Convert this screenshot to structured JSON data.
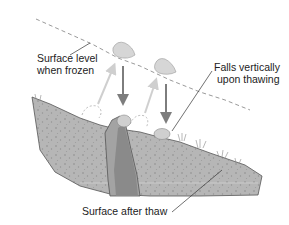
{
  "diagram": {
    "type": "frost heave / frost creep cross-section",
    "labels": {
      "surface_frozen_line1": "Surface level",
      "surface_frozen_line2": "when frozen",
      "falls_line1": "Falls vertically",
      "falls_line2": "upon thawing",
      "surface_after": "Surface after thaw"
    },
    "colors": {
      "soil": "#b4b4b4",
      "soil_dark": "#8e8e8e",
      "rock": "#a7a7a7",
      "rock_dark": "#848484",
      "arrow_down": "#7f7f7f",
      "arrow_up": "#cfcfcf",
      "dashed_line": "#9a9a9a",
      "stone": "#d2d2d2"
    }
  }
}
